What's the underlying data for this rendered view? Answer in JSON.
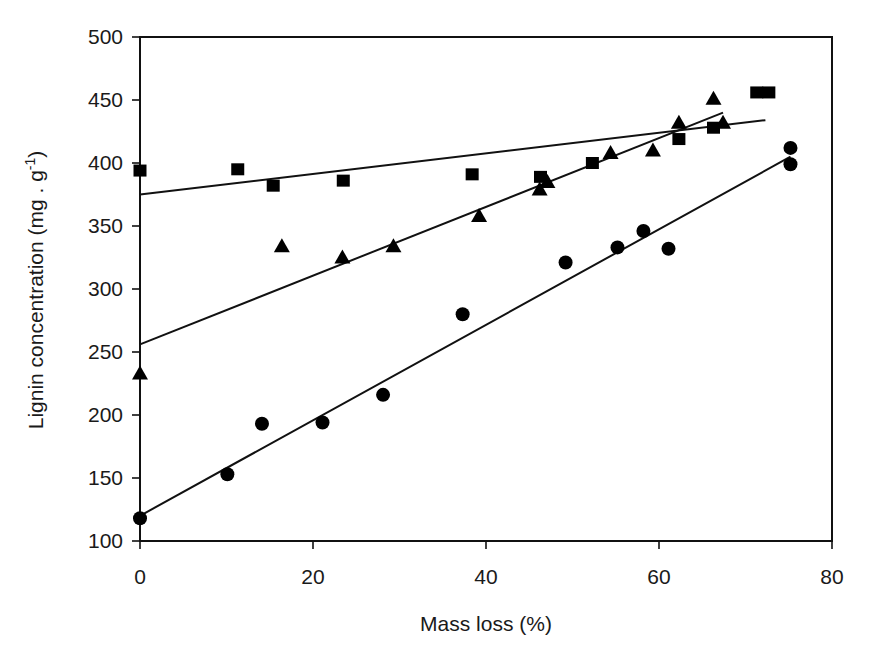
{
  "chart_data": {
    "type": "scatter",
    "title": "",
    "xlabel": "Mass loss (%)",
    "ylabel": "Lignin concentration (mg . g⁻¹)",
    "ylabel_parts": {
      "main": "Lignin concentration (mg . g",
      "sup": "-1",
      "end": ")"
    },
    "xlim": [
      0,
      80
    ],
    "ylim": [
      100,
      500
    ],
    "xticks": [
      0,
      20,
      40,
      60,
      80
    ],
    "yticks": [
      100,
      150,
      200,
      250,
      300,
      350,
      400,
      450,
      500
    ],
    "grid": false,
    "legend": null,
    "series": [
      {
        "name": "squares",
        "marker": "square",
        "points": [
          [
            0,
            394
          ],
          [
            11.3,
            395
          ],
          [
            15.4,
            382
          ],
          [
            23.5,
            386
          ],
          [
            38.4,
            391
          ],
          [
            46.3,
            389
          ],
          [
            52.3,
            400
          ],
          [
            62.3,
            419
          ],
          [
            66.3,
            428
          ],
          [
            71.3,
            456
          ],
          [
            72.7,
            456
          ]
        ],
        "fit": {
          "x0": 0,
          "y0": 375,
          "x1": 72.3,
          "y1": 434
        }
      },
      {
        "name": "triangles",
        "marker": "triangle",
        "points": [
          [
            0,
            233
          ],
          [
            16.4,
            334
          ],
          [
            23.4,
            325
          ],
          [
            29.3,
            334
          ],
          [
            39.2,
            358
          ],
          [
            46.2,
            379
          ],
          [
            47.1,
            385
          ],
          [
            54.4,
            408
          ],
          [
            59.3,
            410
          ],
          [
            62.3,
            432
          ],
          [
            66.3,
            451
          ],
          [
            67.4,
            432
          ]
        ],
        "fit": {
          "x0": 0,
          "y0": 256,
          "x1": 67.4,
          "y1": 440
        }
      },
      {
        "name": "circles",
        "marker": "circle",
        "points": [
          [
            0,
            118
          ],
          [
            10.1,
            153
          ],
          [
            14.1,
            193
          ],
          [
            21.1,
            194
          ],
          [
            28.1,
            216
          ],
          [
            37.3,
            280
          ],
          [
            49.2,
            321
          ],
          [
            55.2,
            333
          ],
          [
            58.2,
            346
          ],
          [
            61.1,
            332
          ],
          [
            75.2,
            399
          ],
          [
            75.2,
            412
          ]
        ],
        "fit": {
          "x0": 0,
          "y0": 120,
          "x1": 75.2,
          "y1": 405
        }
      }
    ]
  },
  "layout": {
    "plot": {
      "left": 140,
      "right": 832,
      "top": 37,
      "bottom": 541
    },
    "colors": {
      "ink": "#000000",
      "background": "#ffffff"
    }
  }
}
